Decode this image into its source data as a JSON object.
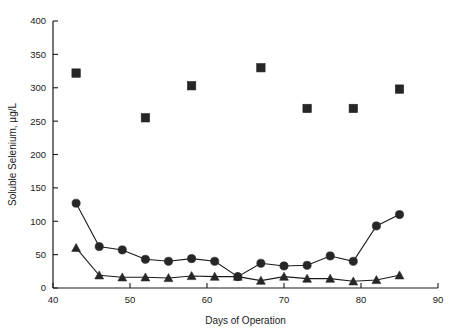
{
  "chart_data": {
    "type": "scatter",
    "title": "",
    "xlabel": "Days of Operation",
    "ylabel": "Soluble Selenium, µg/L",
    "xlim": [
      40,
      90
    ],
    "ylim": [
      0,
      400
    ],
    "xticks": [
      40,
      50,
      60,
      70,
      80,
      90
    ],
    "yticks": [
      0,
      50,
      100,
      150,
      200,
      250,
      300,
      350,
      400
    ],
    "xtick_labels": [
      "40",
      "50",
      "60",
      "70",
      "80",
      "90"
    ],
    "ytick_labels": [
      "0",
      "50",
      "100",
      "150",
      "200",
      "250",
      "300",
      "350",
      "400"
    ],
    "grid": false,
    "legend": "none",
    "series": [
      {
        "name": "squares",
        "marker": "square",
        "connected": false,
        "x": [
          43,
          52,
          58,
          67,
          73,
          79,
          85
        ],
        "y": [
          322,
          255,
          303,
          330,
          269,
          269,
          298
        ]
      },
      {
        "name": "circles",
        "marker": "circle",
        "connected": true,
        "x": [
          43,
          46,
          49,
          52,
          55,
          58,
          61,
          64,
          67,
          70,
          73,
          76,
          79,
          82,
          85
        ],
        "y": [
          127,
          62,
          57,
          43,
          40,
          44,
          40,
          17,
          37,
          33,
          34,
          48,
          40,
          93,
          110
        ]
      },
      {
        "name": "triangles",
        "marker": "triangle",
        "connected": true,
        "x": [
          43,
          46,
          49,
          52,
          55,
          58,
          61,
          64,
          67,
          70,
          73,
          76,
          79,
          82,
          85
        ],
        "y": [
          60,
          19,
          16,
          16,
          15,
          18,
          17,
          17,
          11,
          17,
          14,
          14,
          10,
          12,
          19
        ]
      }
    ]
  }
}
